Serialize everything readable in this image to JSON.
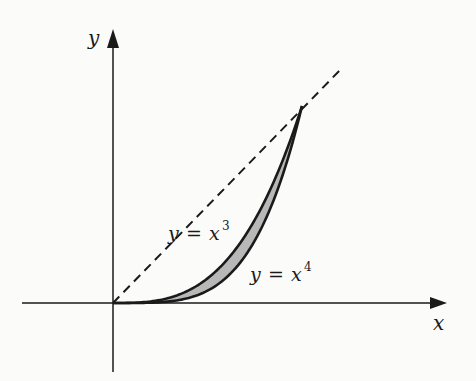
{
  "figure": {
    "axes": {
      "x_label": "x",
      "y_label": "y"
    },
    "curves": [
      {
        "name": "upper",
        "label_var": "y",
        "label_eq": "=",
        "label_base": "x",
        "label_exp": "3",
        "expression": "y = x^3"
      },
      {
        "name": "lower",
        "label_var": "y",
        "label_eq": "=",
        "label_base": "x",
        "label_exp": "4",
        "expression": "y = x^4"
      }
    ],
    "reference_line": {
      "expression": "y = x",
      "style": "dashed"
    },
    "shaded_region": {
      "between": [
        "y = x^3",
        "y = x^4"
      ],
      "x_range": [
        0,
        1
      ],
      "fill": "#b8b8b8"
    },
    "colors": {
      "ink": "#1a1a1a",
      "shade": "#b8b8b8",
      "background": "#fbfbfa"
    }
  }
}
